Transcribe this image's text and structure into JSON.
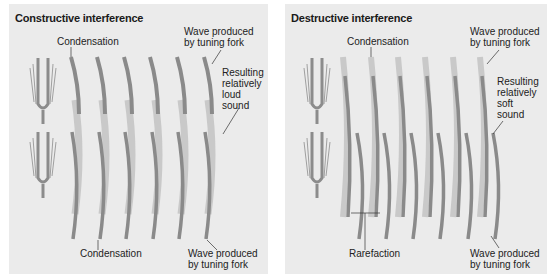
{
  "panels": {
    "constructive": {
      "title": "Constructive interference",
      "labels": {
        "condensation_top": "Condensation",
        "wave_top_1": "Wave produced",
        "wave_top_2": "by tuning fork",
        "result_1": "Resulting",
        "result_2": "relatively",
        "result_3": "loud",
        "result_4": "sound",
        "condensation_bottom": "Condensation",
        "wave_bottom_1": "Wave produced",
        "wave_bottom_2": "by tuning fork"
      }
    },
    "destructive": {
      "title": "Destructive interference",
      "labels": {
        "condensation_top": "Condensation",
        "wave_top_1": "Wave produced",
        "wave_top_2": "by tuning fork",
        "result_1": "Resulting",
        "result_2": "relatively",
        "result_3": "soft",
        "result_4": "sound",
        "rarefaction": "Rarefaction",
        "wave_bottom_1": "Wave produced",
        "wave_bottom_2": "by tuning fork"
      }
    }
  },
  "colors": {
    "panel_bg": "#ebebeb",
    "wave_dark": "#8a8a8a",
    "wave_light": "#c9c9c9",
    "fork": "#8c8c8c"
  },
  "icons": [
    "tuning-fork-icon"
  ]
}
